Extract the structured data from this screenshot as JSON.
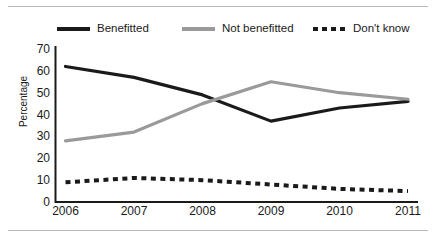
{
  "chart_data": {
    "type": "line",
    "title": "",
    "subtitle": "",
    "xlabel": "",
    "ylabel": "Percentage",
    "categories": [
      "2006",
      "2007",
      "2008",
      "2009",
      "2010",
      "2011"
    ],
    "x": [
      2006,
      2007,
      2008,
      2009,
      2010,
      2011
    ],
    "xlim": [
      2006,
      2011
    ],
    "ylim": [
      0,
      70
    ],
    "yticks": [
      0,
      10,
      20,
      30,
      40,
      50,
      60,
      70
    ],
    "ytick_labels": [
      "0",
      "10",
      "20",
      "30",
      "40",
      "50",
      "60",
      "70"
    ],
    "grid": false,
    "legend_position": "top",
    "series": [
      {
        "name": "Benefitted",
        "values": [
          62,
          57,
          49,
          37,
          43,
          46
        ],
        "color": "#1a1a1a",
        "style": "solid",
        "swatch": "solid-black"
      },
      {
        "name": "Not benefitted",
        "values": [
          28,
          32,
          45,
          55,
          50,
          47
        ],
        "color": "#9a9a9a",
        "style": "solid",
        "swatch": "solid-gray"
      },
      {
        "name": "Don't know",
        "values": [
          9,
          11,
          10,
          8,
          6,
          5
        ],
        "color": "#1a1a1a",
        "style": "dashed",
        "swatch": "dashed-black"
      }
    ]
  },
  "colors": {
    "benefitted": "#1a1a1a",
    "not_benefitted": "#9a9a9a",
    "dont_know": "#1a1a1a",
    "axis": "#1a1a1a",
    "rule": "#b8b8b8",
    "background": "#ffffff"
  }
}
